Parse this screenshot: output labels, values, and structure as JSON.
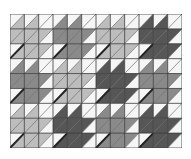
{
  "pattern": {
    "name": "houndstooth-quilt",
    "columns": 12,
    "rows": 9,
    "colors": {
      "W": "#f6f6f6",
      "L": "#bdbdbd",
      "M": "#8a8a8a",
      "D": "#565656",
      "grid": "#3a3a3a",
      "diag": "#222222"
    },
    "cells": [
      [
        "W/L",
        "W/L",
        "W/W",
        "W/M",
        "W/M",
        "W/W",
        "W/L",
        "W/L",
        "W/W",
        "W/D",
        "W/D",
        "W/W"
      ],
      [
        "L/L",
        "L/L",
        "L/W",
        "M/M",
        "M/M",
        "M/W",
        "L/L",
        "L/L",
        "L/W",
        "D/D",
        "D/D",
        "D/W"
      ],
      [
        "W/L*",
        "L/L",
        "L/W",
        "W/M*",
        "M/M",
        "M/W",
        "W/L*",
        "L/L",
        "L/W",
        "W/D*",
        "D/D",
        "D/W"
      ],
      [
        "W/M",
        "W/M",
        "W/W",
        "W/L",
        "W/L",
        "W/W",
        "W/D",
        "W/D",
        "W/W",
        "W/M",
        "W/M",
        "W/W"
      ],
      [
        "M/M",
        "M/M",
        "M/W",
        "L/L",
        "L/L",
        "L/W",
        "D/D",
        "D/D",
        "D/W",
        "M/M",
        "M/M",
        "M/W"
      ],
      [
        "W/M*",
        "M/M",
        "M/W",
        "W/L*",
        "L/L",
        "L/W",
        "W/D*",
        "D/D",
        "D/W",
        "W/M*",
        "M/M",
        "M/W"
      ],
      [
        "W/L",
        "W/L",
        "W/W",
        "W/D",
        "W/D",
        "W/W",
        "W/M",
        "W/M",
        "W/W",
        "W/D",
        "W/D",
        "W/W"
      ],
      [
        "L/L",
        "L/L",
        "L/W",
        "D/D",
        "D/D",
        "D/W",
        "M/M",
        "M/M",
        "M/W",
        "D/D",
        "D/D",
        "D/W"
      ],
      [
        "W/L*",
        "L/L",
        "L/W",
        "W/D*",
        "D/D",
        "D/W",
        "W/M*",
        "M/M",
        "M/W",
        "W/D*",
        "D/D",
        "D/W"
      ]
    ]
  }
}
